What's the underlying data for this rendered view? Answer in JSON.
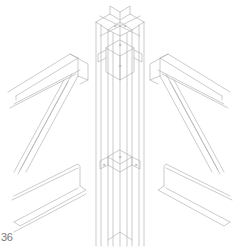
{
  "figure": {
    "number": "36",
    "line_color": "#a8a8a8",
    "background": "#ffffff"
  }
}
